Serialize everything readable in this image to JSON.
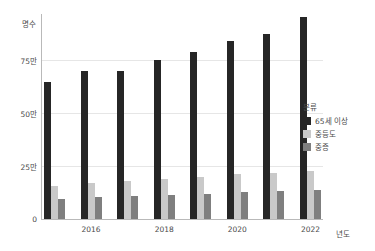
{
  "chart_data": {
    "type": "bar",
    "title": "",
    "xlabel": "년도",
    "ylabel": "명수",
    "categories": [
      "2015",
      "2016",
      "2017",
      "2018",
      "2019",
      "2020",
      "2021",
      "2022"
    ],
    "xtick_labels": [
      "2016",
      "2018",
      "2020",
      "2022"
    ],
    "ytick_labels": [
      "0",
      "25만",
      "50만",
      "75만"
    ],
    "ytick_values": [
      0,
      250000,
      500000,
      750000
    ],
    "ylim": [
      0,
      967000
    ],
    "grid": true,
    "legend_position": "right",
    "legend_title": "분류",
    "series": [
      {
        "name": "65세 이상",
        "color": "#262626",
        "values": [
          645000,
          700000,
          700000,
          750000,
          790000,
          840000,
          875000,
          955000
        ]
      },
      {
        "name": "중등도",
        "color": "#c9c9c9",
        "values": [
          158000,
          170000,
          178000,
          190000,
          200000,
          210000,
          218000,
          228000
        ]
      },
      {
        "name": "중증",
        "color": "#7f7f7f",
        "values": [
          95000,
          102000,
          108000,
          113000,
          120000,
          126000,
          130000,
          136000
        ]
      }
    ]
  },
  "legend": {
    "title": "분류",
    "items": [
      {
        "label": "65세 이상",
        "color": "#262626"
      },
      {
        "label": "중등도",
        "color": "#c9c9c9"
      },
      {
        "label": "중증",
        "color": "#7f7f7f"
      }
    ]
  },
  "axes": {
    "y_title": "명수",
    "x_title": "년도"
  }
}
